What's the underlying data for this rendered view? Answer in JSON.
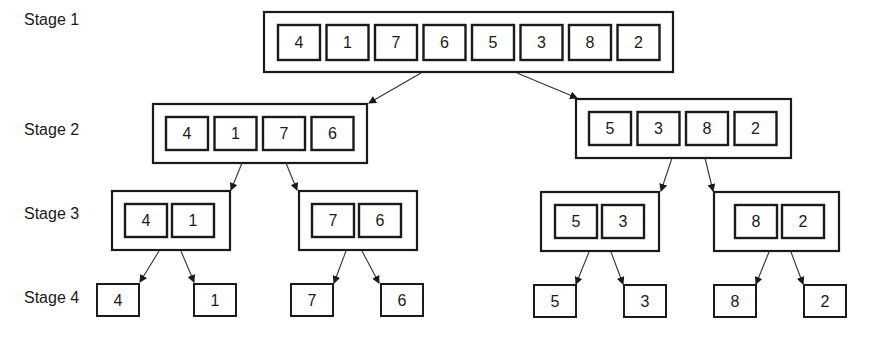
{
  "stages": [
    {
      "label": "Stage 1",
      "groups": [
        [
          "4",
          "1",
          "7",
          "6",
          "5",
          "3",
          "8",
          "2"
        ]
      ]
    },
    {
      "label": "Stage 2",
      "groups": [
        [
          "4",
          "1",
          "7",
          "6"
        ],
        [
          "5",
          "3",
          "8",
          "2"
        ]
      ]
    },
    {
      "label": "Stage 3",
      "groups": [
        [
          "4",
          "1"
        ],
        [
          "7",
          "6"
        ],
        [
          "5",
          "3"
        ],
        [
          "8",
          "2"
        ]
      ]
    },
    {
      "label": "Stage 4",
      "groups": [
        [
          "4"
        ],
        [
          "1"
        ],
        [
          "7"
        ],
        [
          "6"
        ],
        [
          "5"
        ],
        [
          "3"
        ],
        [
          "8"
        ],
        [
          "2"
        ]
      ]
    }
  ],
  "colors": {
    "stroke": "#1a1a1a",
    "background": "#ffffff"
  }
}
